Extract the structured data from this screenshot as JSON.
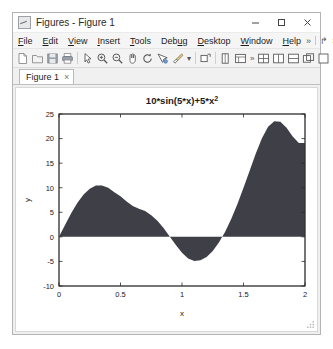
{
  "window": {
    "title": "Figures - Figure 1",
    "icon": "matlab-figure-icon",
    "controls": [
      {
        "name": "minimize",
        "glyph": "minimize-icon"
      },
      {
        "name": "maximize",
        "glyph": "maximize-icon"
      },
      {
        "name": "close",
        "glyph": "close-icon"
      }
    ]
  },
  "menubar": {
    "items": [
      {
        "label": "File",
        "mnemonic": "F"
      },
      {
        "label": "Edit",
        "mnemonic": "E"
      },
      {
        "label": "View",
        "mnemonic": "V"
      },
      {
        "label": "Insert",
        "mnemonic": "I"
      },
      {
        "label": "Tools",
        "mnemonic": "T"
      },
      {
        "label": "Debug",
        "mnemonic": "u"
      },
      {
        "label": "Desktop",
        "mnemonic": "D"
      },
      {
        "label": "Window",
        "mnemonic": "W"
      },
      {
        "label": "Help",
        "mnemonic": "H"
      }
    ],
    "right": {
      "overflow_label": "»",
      "undock_label": "↱",
      "close_label": "×"
    }
  },
  "toolbar": {
    "buttons": [
      {
        "name": "new-figure",
        "icon": "new-document-icon"
      },
      {
        "name": "open-file",
        "icon": "open-folder-icon"
      },
      {
        "name": "save-figure",
        "icon": "save-disk-icon"
      },
      {
        "name": "print-figure",
        "icon": "printer-icon"
      },
      {
        "name": "edit-plot",
        "icon": "arrow-pointer-icon"
      },
      {
        "name": "zoom-in",
        "icon": "zoom-in-icon"
      },
      {
        "name": "zoom-out",
        "icon": "zoom-out-icon"
      },
      {
        "name": "pan",
        "icon": "hand-pan-icon"
      },
      {
        "name": "rotate-3d",
        "icon": "rotate-3d-icon"
      },
      {
        "name": "data-cursor",
        "icon": "data-cursor-icon"
      },
      {
        "name": "brush-select",
        "icon": "brush-icon"
      },
      {
        "name": "link-plot",
        "icon": "link-icon"
      },
      {
        "name": "insert-colorbar",
        "icon": "colorbar-icon"
      },
      {
        "name": "insert-legend",
        "icon": "legend-icon"
      },
      {
        "name": "hide-plot-tools",
        "icon": "plot-tools-icon"
      }
    ],
    "overflow_label": "»",
    "dock_buttons": [
      {
        "name": "tile-layout",
        "icon": "grid-layout-icon"
      },
      {
        "name": "split-vertical",
        "icon": "split-vertical-icon"
      },
      {
        "name": "split-horizontal",
        "icon": "split-horizontal-icon"
      },
      {
        "name": "float-window",
        "icon": "float-window-icon"
      },
      {
        "name": "maximize-panel",
        "icon": "maximize-panel-icon"
      }
    ]
  },
  "tabs": [
    {
      "label": "Figure 1",
      "close_label": "×",
      "active": true
    }
  ],
  "chart_data": {
    "type": "area",
    "title_base": "10*sin(5*x)+5*x",
    "title_exponent": "2",
    "xlabel": "x",
    "ylabel": "y",
    "xlim": [
      0,
      2
    ],
    "ylim": [
      -10,
      25
    ],
    "xticks": [
      0,
      0.5,
      1,
      1.5,
      2
    ],
    "xticklabels": [
      "0",
      "0.5",
      "1",
      "1.5",
      "2"
    ],
    "yticks": [
      -10,
      -5,
      0,
      5,
      10,
      15,
      20,
      25
    ],
    "yticklabels": [
      "-10",
      "-5",
      "0",
      "5",
      "10",
      "15",
      "20",
      "25"
    ],
    "grid": false,
    "fill_color": "#3f3f47",
    "expression": "10*sin(5*x)+5*x^2",
    "x": [
      0,
      0.05,
      0.1,
      0.15,
      0.2,
      0.25,
      0.3,
      0.35,
      0.4,
      0.45,
      0.5,
      0.55,
      0.6,
      0.65,
      0.7,
      0.75,
      0.8,
      0.85,
      0.9,
      0.95,
      1.0,
      1.05,
      1.1,
      1.15,
      1.2,
      1.25,
      1.3,
      1.35,
      1.4,
      1.45,
      1.5,
      1.55,
      1.6,
      1.65,
      1.7,
      1.75,
      1.8,
      1.85,
      1.9,
      1.95,
      2.0
    ],
    "y": [
      0.0,
      2.48,
      4.84,
      6.93,
      8.62,
      9.8,
      10.43,
      10.47,
      10.0,
      9.07,
      8.24,
      7.2,
      6.3,
      5.7,
      5.25,
      4.41,
      3.27,
      1.78,
      0.09,
      -1.66,
      -3.21,
      -4.4,
      -4.92,
      -4.78,
      -4.12,
      -2.88,
      -1.15,
      1.01,
      3.64,
      6.64,
      9.99,
      13.46,
      16.95,
      20.09,
      22.4,
      23.5,
      23.4,
      22.2,
      20.4,
      19.1,
      19.09
    ],
    "zero_crossings": [
      0.0,
      0.905,
      1.355
    ]
  }
}
